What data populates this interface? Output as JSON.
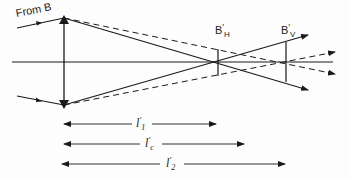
{
  "diagram": {
    "source_label": "From B",
    "image_labels": {
      "horizontal": {
        "base": "B",
        "prime": "′",
        "sub": "H"
      },
      "vertical": {
        "base": "B",
        "prime": "′",
        "sub": "V"
      }
    },
    "distances": [
      {
        "base": "l",
        "prime": "′",
        "sub": "1"
      },
      {
        "base": "l",
        "prime": "′",
        "sub": "c"
      },
      {
        "base": "l",
        "prime": "′",
        "sub": "2"
      }
    ],
    "colors": {
      "line": "#1a1a1a",
      "background": "#fdfdfd"
    }
  }
}
